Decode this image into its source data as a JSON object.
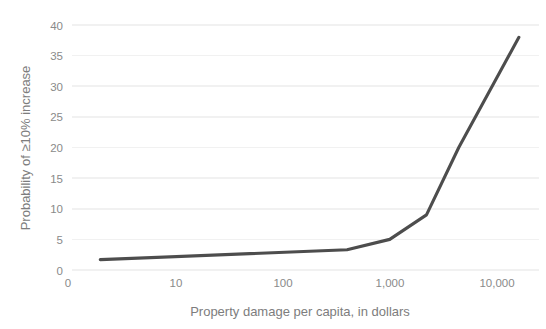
{
  "chart_data": {
    "type": "line",
    "title": "",
    "subtitle": "",
    "xlabel": "Property damage per capita, in dollars",
    "ylabel": "Probability of ≥10% increase",
    "xscale": "log",
    "yscale": "linear",
    "grid": "horizontal",
    "legend": "none",
    "xlim": [
      1.5,
      22000
    ],
    "ylim": [
      0,
      41
    ],
    "x_ticks": [
      "0",
      "10",
      "100",
      "1,000",
      "10,000"
    ],
    "x_tick_values": [
      1,
      10,
      100,
      1000,
      10000
    ],
    "y_ticks": [
      "0",
      "5",
      "10",
      "15",
      "20",
      "25",
      "30",
      "35",
      "40"
    ],
    "y_tick_values": [
      0,
      5,
      10,
      15,
      20,
      25,
      30,
      35,
      40
    ],
    "series": [
      {
        "name": "Probability of ≥10% increase",
        "color": "#4d4d4d",
        "x": [
          2,
          400,
          1000,
          2200,
          4400,
          16000
        ],
        "y": [
          1.7,
          3.3,
          5.0,
          9.0,
          20.0,
          38.0
        ]
      }
    ]
  },
  "axes": {
    "y_axis_title": "Probability of ≥10% increase",
    "x_axis_title": "Property damage per capita, in dollars"
  },
  "ticks": {
    "y": [
      "40",
      "35",
      "30",
      "25",
      "20",
      "15",
      "10",
      "5",
      "0"
    ],
    "x": [
      "0",
      "10",
      "100",
      "1,000",
      "10,000"
    ]
  },
  "colors": {
    "line": "#4d4d4d",
    "gridline": "#f1f1f1",
    "text": "#8a8a8a",
    "background": "#ffffff"
  }
}
